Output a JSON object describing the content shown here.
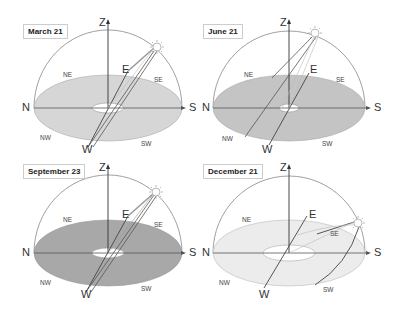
{
  "figure": {
    "panels": [
      {
        "title": "March 21",
        "fill": "#d6d6d6",
        "directions": {
          "z": "Z",
          "n": "N",
          "s": "S",
          "e": "E",
          "w": "W",
          "ne": "NE",
          "se": "SE",
          "nw": "NW",
          "sw": "SW"
        }
      },
      {
        "title": "June 21",
        "fill": "#c4c4c4",
        "directions": {
          "z": "Z",
          "n": "N",
          "s": "S",
          "e": "E",
          "w": "W",
          "ne": "NE",
          "se": "SE",
          "nw": "NW",
          "sw": "SW"
        }
      },
      {
        "title": "September 23",
        "fill": "#a8a8a8",
        "directions": {
          "z": "Z",
          "n": "N",
          "s": "S",
          "e": "E",
          "w": "W",
          "ne": "NE",
          "se": "SE",
          "nw": "NW",
          "sw": "SW"
        }
      },
      {
        "title": "December 21",
        "fill": "#ececec",
        "directions": {
          "z": "Z",
          "n": "N",
          "s": "S",
          "e": "E",
          "w": "W",
          "ne": "NE",
          "se": "SE",
          "nw": "NW",
          "sw": "SW"
        }
      }
    ]
  }
}
